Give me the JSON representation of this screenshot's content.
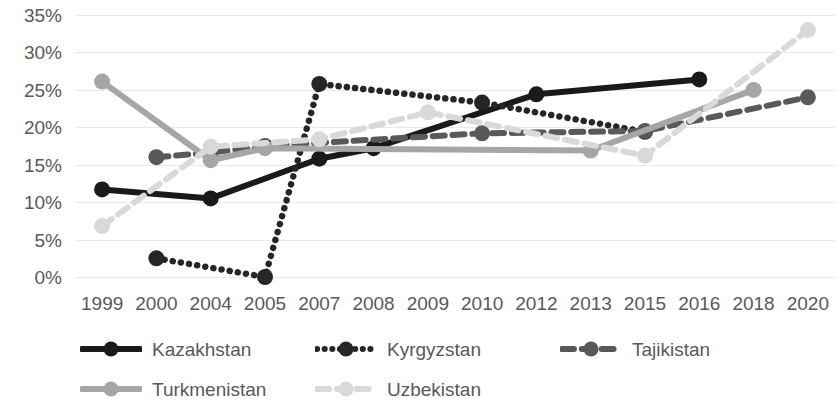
{
  "chart_data": {
    "type": "line",
    "title": "",
    "xlabel": "",
    "ylabel": "",
    "ylim": [
      0,
      35
    ],
    "y_ticks": [
      "0%",
      "5%",
      "10%",
      "15%",
      "20%",
      "25%",
      "30%",
      "35%"
    ],
    "y_tick_values": [
      0,
      5,
      10,
      15,
      20,
      25,
      30,
      35
    ],
    "grid": true,
    "legend_position": "bottom",
    "categories": [
      "1999",
      "2000",
      "2004",
      "2005",
      "2007",
      "2008",
      "2009",
      "2010",
      "2012",
      "2013",
      "2015",
      "2016",
      "2018",
      "2020"
    ],
    "series": [
      {
        "name": "Kazakhstan",
        "color": "#1a1a1a",
        "style": "solid",
        "values": [
          11.7,
          null,
          10.5,
          null,
          15.8,
          17.2,
          null,
          null,
          24.4,
          null,
          null,
          26.4,
          null,
          null
        ]
      },
      {
        "name": "Kyrgyzstan",
        "color": "#262626",
        "style": "dotted",
        "values": [
          null,
          2.5,
          null,
          0.0,
          25.8,
          null,
          null,
          23.3,
          null,
          null,
          19.4,
          null,
          null,
          null
        ]
      },
      {
        "name": "Tajikistan",
        "color": "#595959",
        "style": "dashed",
        "values": [
          null,
          16.0,
          16.6,
          17.5,
          null,
          null,
          null,
          19.2,
          null,
          null,
          19.5,
          null,
          null,
          24.0
        ]
      },
      {
        "name": "Turkmenistan",
        "color": "#a6a6a6",
        "style": "solid",
        "values": [
          26.1,
          null,
          15.6,
          17.2,
          null,
          null,
          null,
          null,
          null,
          16.9,
          null,
          null,
          25.0,
          null
        ]
      },
      {
        "name": "Uzbekistan",
        "color": "#d9d9d9",
        "style": "dashed",
        "values": [
          6.8,
          null,
          17.4,
          null,
          18.4,
          null,
          22.0,
          null,
          null,
          null,
          16.2,
          null,
          null,
          33.0
        ]
      }
    ]
  },
  "legend": {
    "items": [
      {
        "label": "Kazakhstan"
      },
      {
        "label": "Kyrgyzstan"
      },
      {
        "label": "Tajikistan"
      },
      {
        "label": "Turkmenistan"
      },
      {
        "label": "Uzbekistan"
      }
    ]
  }
}
